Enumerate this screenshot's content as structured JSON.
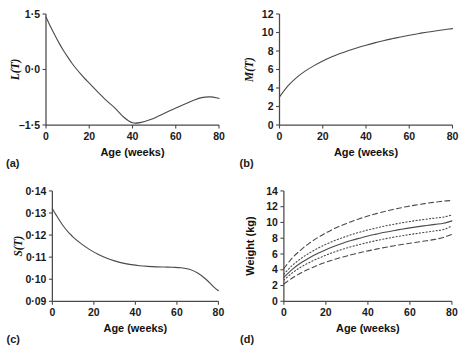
{
  "figure": {
    "panel_letters": [
      "(a)",
      "(b)",
      "(c)",
      "(d)"
    ],
    "shared_xlabel": "Age (weeks)",
    "line_color": "#4a4a4a",
    "text_color": "#1a1a1a",
    "background": "#ffffff"
  },
  "chart_data": [
    {
      "id": "panel-a",
      "type": "line",
      "panel_label": "(a)",
      "title": "",
      "xlabel": "Age (weeks)",
      "ylabel": "L(T)",
      "ylabel_display": "L(T)",
      "xlim": [
        0,
        80
      ],
      "ylim": [
        -1.5,
        1.5
      ],
      "xticks": [
        0,
        20,
        40,
        60,
        80
      ],
      "xticklabels": [
        "0",
        "20",
        "40",
        "60",
        "80"
      ],
      "yticks": [
        -1.5,
        0.0,
        1.5
      ],
      "yticklabels": [
        "–1·5",
        "0·0",
        "1·5"
      ],
      "grid": false,
      "legend": "none",
      "series": [
        {
          "name": "L(T)",
          "style": "solid",
          "x": [
            0,
            2,
            4,
            6,
            8,
            10,
            12,
            14,
            16,
            18,
            20,
            24,
            28,
            32,
            36,
            40,
            44,
            48,
            52,
            56,
            60,
            64,
            68,
            72,
            76,
            80
          ],
          "y": [
            1.42,
            1.17,
            0.94,
            0.72,
            0.52,
            0.34,
            0.17,
            0.02,
            -0.12,
            -0.25,
            -0.37,
            -0.61,
            -0.84,
            -1.05,
            -1.29,
            -1.44,
            -1.43,
            -1.36,
            -1.26,
            -1.15,
            -1.04,
            -0.94,
            -0.84,
            -0.76,
            -0.74,
            -0.78
          ]
        }
      ]
    },
    {
      "id": "panel-b",
      "type": "line",
      "panel_label": "(b)",
      "title": "",
      "xlabel": "Age (weeks)",
      "ylabel": "M(T)",
      "ylabel_display": "M(T)",
      "xlim": [
        0,
        80
      ],
      "ylim": [
        0,
        12
      ],
      "xticks": [
        0,
        20,
        40,
        60,
        80
      ],
      "xticklabels": [
        "0",
        "20",
        "40",
        "60",
        "80"
      ],
      "yticks": [
        0,
        2,
        4,
        6,
        8,
        10,
        12
      ],
      "yticklabels": [
        "0",
        "2",
        "4",
        "6",
        "8",
        "10",
        "12"
      ],
      "grid": false,
      "legend": "none",
      "series": [
        {
          "name": "M(T)",
          "style": "solid",
          "x": [
            0,
            4,
            8,
            12,
            16,
            20,
            24,
            28,
            32,
            36,
            40,
            44,
            48,
            52,
            56,
            60,
            64,
            68,
            72,
            76,
            80
          ],
          "y": [
            3.05,
            4.25,
            5.15,
            5.85,
            6.42,
            6.92,
            7.35,
            7.72,
            8.06,
            8.36,
            8.63,
            8.88,
            9.11,
            9.32,
            9.52,
            9.7,
            9.87,
            10.03,
            10.17,
            10.3,
            10.42
          ]
        }
      ]
    },
    {
      "id": "panel-c",
      "type": "line",
      "panel_label": "(c)",
      "title": "",
      "xlabel": "Age (weeks)",
      "ylabel": "S(T)",
      "ylabel_display": "S(T)",
      "xlim": [
        0,
        80
      ],
      "ylim": [
        0.09,
        0.14
      ],
      "xticks": [
        0,
        20,
        40,
        60,
        80
      ],
      "xticklabels": [
        "0",
        "20",
        "40",
        "60",
        "80"
      ],
      "yticks": [
        0.09,
        0.1,
        0.11,
        0.12,
        0.13,
        0.14
      ],
      "yticklabels": [
        "0·09",
        "0·10",
        "0·11",
        "0·12",
        "0·13",
        "0·14"
      ],
      "grid": false,
      "legend": "none",
      "series": [
        {
          "name": "S(T)",
          "style": "solid",
          "x": [
            0,
            2,
            4,
            6,
            8,
            10,
            14,
            18,
            22,
            26,
            30,
            34,
            38,
            42,
            46,
            50,
            54,
            58,
            62,
            66,
            70,
            74,
            78,
            80
          ],
          "y": [
            0.132,
            0.1288,
            0.1258,
            0.1232,
            0.121,
            0.1191,
            0.116,
            0.1134,
            0.1113,
            0.1096,
            0.1083,
            0.1073,
            0.1066,
            0.1061,
            0.1058,
            0.1056,
            0.1055,
            0.1054,
            0.1052,
            0.1045,
            0.1028,
            0.1,
            0.0963,
            0.0948
          ]
        }
      ]
    },
    {
      "id": "panel-d",
      "type": "line",
      "panel_label": "(d)",
      "title": "",
      "xlabel": "Age (weeks)",
      "ylabel": "Weight (kg)",
      "ylabel_display": "Weight (kg)",
      "xlim": [
        0,
        80
      ],
      "ylim": [
        0,
        14
      ],
      "xticks": [
        0,
        20,
        40,
        60,
        80
      ],
      "xticklabels": [
        "0",
        "20",
        "40",
        "60",
        "80"
      ],
      "yticks": [
        0,
        2,
        4,
        6,
        8,
        10,
        12,
        14
      ],
      "yticklabels": [
        "0",
        "2",
        "4",
        "6",
        "8",
        "10",
        "12",
        "14"
      ],
      "grid": false,
      "legend": "none",
      "series": [
        {
          "name": "97th centile",
          "style": "dashed",
          "x": [
            0,
            4,
            8,
            12,
            16,
            20,
            24,
            28,
            32,
            36,
            40,
            44,
            48,
            52,
            56,
            60,
            64,
            68,
            72,
            76,
            80
          ],
          "y": [
            4.15,
            5.5,
            6.5,
            7.35,
            8.05,
            8.68,
            9.22,
            9.68,
            10.1,
            10.48,
            10.82,
            11.12,
            11.4,
            11.65,
            11.88,
            12.08,
            12.26,
            12.43,
            12.58,
            12.7,
            12.8
          ]
        },
        {
          "name": "75th centile",
          "style": "dotted",
          "x": [
            0,
            4,
            8,
            12,
            16,
            20,
            24,
            28,
            32,
            36,
            40,
            44,
            48,
            52,
            56,
            60,
            64,
            68,
            72,
            76,
            80
          ],
          "y": [
            3.45,
            4.55,
            5.4,
            6.1,
            6.7,
            7.22,
            7.68,
            8.08,
            8.44,
            8.76,
            9.05,
            9.3,
            9.54,
            9.75,
            9.95,
            10.12,
            10.28,
            10.42,
            10.56,
            10.68,
            10.95
          ]
        },
        {
          "name": "50th centile",
          "style": "solid",
          "x": [
            0,
            4,
            8,
            12,
            16,
            20,
            24,
            28,
            32,
            36,
            40,
            44,
            48,
            52,
            56,
            60,
            64,
            68,
            72,
            76,
            80
          ],
          "y": [
            3.05,
            4.05,
            4.85,
            5.5,
            6.05,
            6.55,
            6.98,
            7.36,
            7.7,
            8.0,
            8.28,
            8.52,
            8.75,
            8.95,
            9.14,
            9.31,
            9.47,
            9.62,
            9.76,
            9.9,
            10.2
          ]
        },
        {
          "name": "25th centile",
          "style": "dotted",
          "x": [
            0,
            4,
            8,
            12,
            16,
            20,
            24,
            28,
            32,
            36,
            40,
            44,
            48,
            52,
            56,
            60,
            64,
            68,
            72,
            76,
            80
          ],
          "y": [
            2.7,
            3.6,
            4.32,
            4.9,
            5.4,
            5.85,
            6.25,
            6.6,
            6.92,
            7.2,
            7.46,
            7.7,
            7.92,
            8.12,
            8.3,
            8.47,
            8.63,
            8.78,
            8.93,
            9.1,
            9.55
          ]
        },
        {
          "name": "3rd centile",
          "style": "dashed",
          "x": [
            0,
            4,
            8,
            12,
            16,
            20,
            24,
            28,
            32,
            36,
            40,
            44,
            48,
            52,
            56,
            60,
            64,
            68,
            72,
            76,
            80
          ],
          "y": [
            2.2,
            2.95,
            3.58,
            4.1,
            4.55,
            4.95,
            5.3,
            5.62,
            5.9,
            6.16,
            6.4,
            6.62,
            6.83,
            7.02,
            7.2,
            7.37,
            7.53,
            7.68,
            7.85,
            8.1,
            8.5
          ]
        }
      ]
    }
  ]
}
